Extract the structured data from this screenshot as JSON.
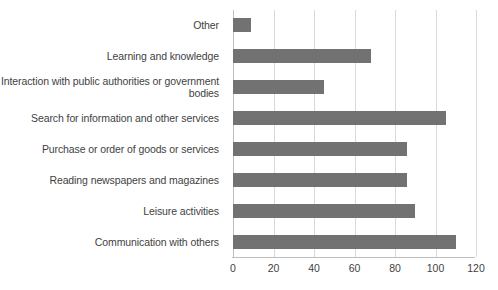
{
  "chart_data": {
    "type": "bar",
    "orientation": "horizontal",
    "title": "",
    "xlabel": "",
    "ylabel": "",
    "xlim": [
      0,
      120
    ],
    "xticks": [
      0,
      20,
      40,
      60,
      80,
      100,
      120
    ],
    "grid": true,
    "legend": false,
    "bar_color": "#727272",
    "gridline_color": "#d9d9d9",
    "categories": [
      "Other",
      "Learning and knowledge",
      "Interaction with public authorities or government bodies",
      "Search for information and other services",
      "Purchase or order of goods or services",
      "Reading newspapers and magazines",
      "Leisure activities",
      "Communication with others"
    ],
    "values": [
      9,
      68,
      45,
      105,
      86,
      86,
      90,
      110
    ]
  }
}
